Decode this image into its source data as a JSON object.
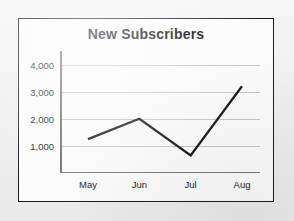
{
  "chart_data": {
    "type": "line",
    "title": "New Subscribers",
    "xlabel": "",
    "ylabel": "",
    "categories": [
      "May",
      "Jun",
      "Jul",
      "Aug"
    ],
    "values": [
      1250,
      2000,
      650,
      3200
    ],
    "series": [
      {
        "name": "New Subscribers",
        "values": [
          1250,
          2000,
          650,
          3200
        ]
      }
    ],
    "ylim": [
      0,
      4500
    ],
    "y_ticks": [
      1000,
      2000,
      3000,
      4000
    ],
    "y_tick_labels": [
      "1,000",
      "2,000",
      "3,000",
      "4,000"
    ],
    "x_tick_labels": [
      "May",
      "Jun",
      "Jul",
      "Aug"
    ],
    "grid": true,
    "grid_axis": "y",
    "legend": false,
    "legend_position": "none",
    "line_color": "#111111",
    "line_width": 2.2,
    "markers": false,
    "background_color": "#fbfbfb",
    "page_background_color": "#f2f2f2",
    "frame_color": "#1b1b1b",
    "gridline_color": "#c6c6c6",
    "axis_color": "#6e6e6e"
  }
}
